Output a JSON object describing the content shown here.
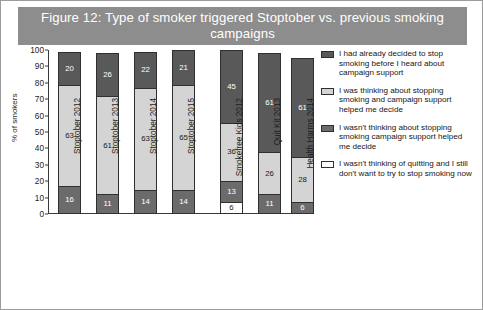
{
  "figure": {
    "title": "Figure 12: Type of smoker triggered Stoptober vs. previous smoking campaigns",
    "title_band_color": "#8d8d8d",
    "border_color": "#9b9b9b"
  },
  "chart_data": {
    "type": "bar",
    "subtype": "stacked-column",
    "title": "Figure 12: Type of smoker triggered Stoptober vs. previous smoking campaigns",
    "xlabel": "",
    "ylabel": "% of smokers",
    "ylim": [
      0,
      100
    ],
    "yticks": [
      0,
      10,
      20,
      30,
      40,
      50,
      60,
      70,
      80,
      90,
      100
    ],
    "grid": false,
    "legend_position": "right",
    "categories": [
      "Stoptober 2012",
      "Stoptober 2013",
      "Stoptober 2014",
      "Stoptober 2015",
      "Smokefree Kids 2012",
      "Quit Kit 2013",
      "Health Harms 2014"
    ],
    "series": [
      {
        "name": "I wasn't thinking of quitting and I still don't want to try to stop smoking now",
        "color": "#fdfdfd",
        "values": [
          null,
          null,
          null,
          null,
          6,
          null,
          null
        ]
      },
      {
        "name": "I wasn't thinking about stopping smoking campaign support helped me decide",
        "color": "#6b6b6b",
        "values": [
          16,
          11,
          14,
          14,
          13,
          11,
          6
        ]
      },
      {
        "name": "I was thinking about stopping smoking and campaign support helped me decide",
        "color": "#d4d4d4",
        "values": [
          63,
          61,
          63,
          65,
          36,
          26,
          28
        ]
      },
      {
        "name": "I had already decided to stop smoking before I heard about campaign support",
        "color": "#595959",
        "values": [
          20,
          26,
          22,
          21,
          45,
          61,
          61
        ]
      }
    ]
  },
  "legend": {
    "items": [
      {
        "label": "I had already decided to stop smoking before I heard about campaign support",
        "color": "#595959"
      },
      {
        "label": "I was thinking about stopping smoking and campaign support helped me decide",
        "color": "#d4d4d4"
      },
      {
        "label": "I wasn't thinking about stopping smoking campaign support helped me decide",
        "color": "#6b6b6b"
      },
      {
        "label": "I wasn't thinking of quitting and I still don't want to try to stop smoking now",
        "color": "#fdfdfd"
      }
    ]
  }
}
